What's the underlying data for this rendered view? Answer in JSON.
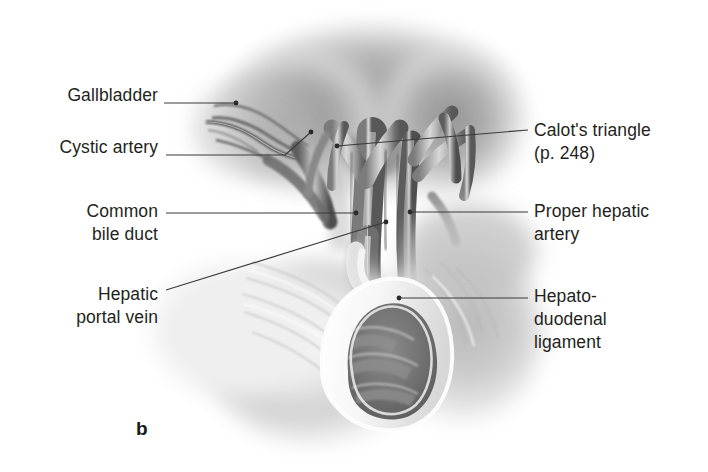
{
  "figure": {
    "letter": "b",
    "caption_letter_name": "figure-part-label",
    "background_color": "#ffffff",
    "ink_color": "#231f20",
    "leader_color": "#3a3a3a"
  },
  "labels": {
    "left": [
      {
        "id": "gallbladder",
        "text": "Gallbladder",
        "leader": "straight"
      },
      {
        "id": "cystic_artery",
        "text": "Cystic artery",
        "leader": "elbow"
      },
      {
        "id": "common_bile_duct",
        "text": "Common\nbile duct",
        "leader": "straight"
      },
      {
        "id": "hepatic_portal_vein",
        "text": "Hepatic\nportal vein",
        "leader": "diagonal"
      }
    ],
    "right": [
      {
        "id": "calots_triangle",
        "text": "Calot's triangle\n(p. 248)",
        "leader": "diagonal"
      },
      {
        "id": "proper_hepatic_artery",
        "text": "Proper hepatic\nartery",
        "leader": "straight"
      },
      {
        "id": "hepatoduodenal_ligament",
        "text": "Hepato-\nduodenal\nligament",
        "leader": "straight"
      }
    ]
  },
  "illustration": {
    "type": "anatomical-line-and-wash-drawing",
    "subject": "hepatoduodenal ligament and portal triad",
    "structures": [
      "liver",
      "gallbladder",
      "cystic artery",
      "common bile duct",
      "hepatic portal vein",
      "proper hepatic artery",
      "duodenum",
      "hepatoduodenal ligament"
    ],
    "palette": {
      "liver_shadow": "#8e8e8e",
      "vessel_dark": "#4a4a4a",
      "vessel_mid": "#9a9a9a",
      "vessel_light": "#dedede",
      "tissue_light": "#f2f2f2",
      "lumen_dark": "#6b6b6b"
    }
  }
}
